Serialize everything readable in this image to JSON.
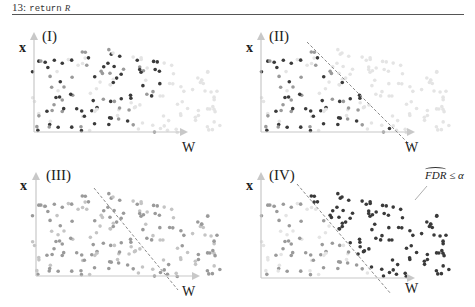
{
  "header": {
    "line_number": "13:",
    "keyword": "return",
    "variable": "R"
  },
  "colors": {
    "dark_point": "#3a3a3a",
    "medium_point": "#9a9a9a",
    "faint_point": "#e4e4e4",
    "axis": "#c8c8c8",
    "divider_line": "#8a8a8a",
    "rule": "#555555"
  },
  "panels": [
    {
      "id": "I",
      "label": "(I)",
      "y_axis_label": "x",
      "x_axis_label": "W",
      "has_divider": false,
      "description": "Points in cloud; selected dark points scattered left"
    },
    {
      "id": "II",
      "label": "(II)",
      "y_axis_label": "x",
      "x_axis_label": "W",
      "has_divider": true,
      "description": "Same points with dashed decision boundary"
    },
    {
      "id": "III",
      "label": "(III)",
      "y_axis_label": "x",
      "x_axis_label": "W",
      "has_divider": true,
      "description": "All points medium gray with dashed boundary"
    },
    {
      "id": "IV",
      "label": "(IV)",
      "y_axis_label": "x",
      "x_axis_label": "W",
      "has_divider": true,
      "description": "Points right of boundary dark (selected)",
      "annotation": {
        "hat_text": "FDR",
        "rest": " ≤ α"
      }
    }
  ]
}
